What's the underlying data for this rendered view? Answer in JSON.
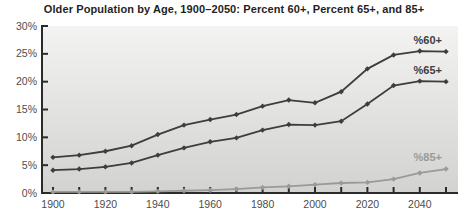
{
  "title": "Older Population by Age, 1900–2050: Percent 60+, Percent 65+, and 85+",
  "chart_data": {
    "type": "line",
    "title": "Older Population by Age, 1900–2050: Percent 60+, Percent 65+, and 85+",
    "x": [
      1900,
      1910,
      1920,
      1930,
      1940,
      1950,
      1960,
      1970,
      1980,
      1990,
      2000,
      2010,
      2020,
      2030,
      2040,
      2050
    ],
    "series": [
      {
        "name": "%60+",
        "color": "#3d3d3d",
        "values": [
          6.4,
          6.8,
          7.5,
          8.5,
          10.5,
          12.2,
          13.2,
          14.1,
          15.6,
          16.7,
          16.2,
          18.2,
          22.3,
          24.8,
          25.5,
          25.4
        ]
      },
      {
        "name": "%65+",
        "color": "#3d3d3d",
        "values": [
          4.1,
          4.3,
          4.7,
          5.4,
          6.8,
          8.1,
          9.2,
          9.9,
          11.3,
          12.3,
          12.2,
          12.9,
          16.0,
          19.3,
          20.1,
          20.0
        ]
      },
      {
        "name": "%85+",
        "color": "#9a9a97",
        "values": [
          0.2,
          0.2,
          0.2,
          0.2,
          0.3,
          0.4,
          0.5,
          0.7,
          1.0,
          1.2,
          1.5,
          1.8,
          1.9,
          2.5,
          3.6,
          4.3
        ]
      }
    ],
    "ylim": [
      0,
      30
    ],
    "yticks": [
      0,
      5,
      10,
      15,
      20,
      25,
      30
    ],
    "ytick_labels": [
      "0%",
      "5%",
      "10%",
      "15%",
      "20%",
      "25%",
      "30%"
    ],
    "xticks_minor": [
      1900,
      1910,
      1920,
      1930,
      1940,
      1950,
      1960,
      1970,
      1980,
      1990,
      2000,
      2010,
      2020,
      2030,
      2040,
      2050
    ],
    "xtick_labeled": [
      1900,
      1920,
      1940,
      1960,
      1980,
      2000,
      2020,
      2040
    ],
    "xtick_labels": [
      "1900",
      "1920",
      "1940",
      "1960",
      "1980",
      "2000",
      "2020",
      "2040"
    ],
    "grid": false,
    "legend": "end-of-line labels",
    "colors": {
      "axis": "#2b2b2b",
      "tick_label": "#4d4d4d",
      "plot_bg_top": "#f3f3f1",
      "plot_bg_bottom": "#d2d2d0",
      "page_bg": "#ffffff",
      "title_text": "#1f1f1f",
      "dark_series": "#3d3d3d",
      "light_series": "#9a9a97"
    }
  }
}
